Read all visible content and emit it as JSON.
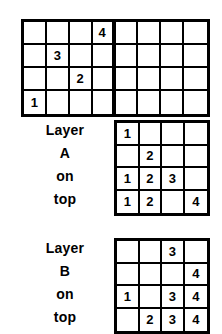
{
  "figure": {
    "ink_color": "#000000",
    "background_color": "#ffffff"
  },
  "chart_data": {
    "type": "table",
    "title": "",
    "grids": [
      {
        "name": "combined-top-grid",
        "rows": 4,
        "cols": 8,
        "divider_after_col": 4,
        "values": [
          [
            "",
            "",
            "",
            "4",
            "",
            "",
            "",
            ""
          ],
          [
            "",
            "3",
            "",
            "",
            "",
            "",
            "",
            ""
          ],
          [
            "",
            "",
            "2",
            "",
            "",
            "",
            "",
            ""
          ],
          [
            "1",
            "",
            "",
            "",
            "",
            "",
            "",
            ""
          ]
        ]
      },
      {
        "name": "layer-a-grid",
        "rows": 4,
        "cols": 4,
        "values": [
          [
            "1",
            "",
            "",
            ""
          ],
          [
            "",
            "2",
            "",
            ""
          ],
          [
            "1",
            "2",
            "3",
            ""
          ],
          [
            "1",
            "2",
            "",
            "4"
          ]
        ]
      },
      {
        "name": "layer-b-grid",
        "rows": 4,
        "cols": 4,
        "values": [
          [
            "",
            "",
            "3",
            ""
          ],
          [
            "",
            "",
            "",
            "4"
          ],
          [
            "1",
            "",
            "3",
            "4"
          ],
          [
            "",
            "2",
            "3",
            "4"
          ]
        ]
      }
    ]
  },
  "layer_a": {
    "label_lines": [
      "Layer",
      "A",
      "on",
      "top"
    ]
  },
  "layer_b": {
    "label_lines": [
      "Layer",
      "B",
      "on",
      "top"
    ]
  }
}
